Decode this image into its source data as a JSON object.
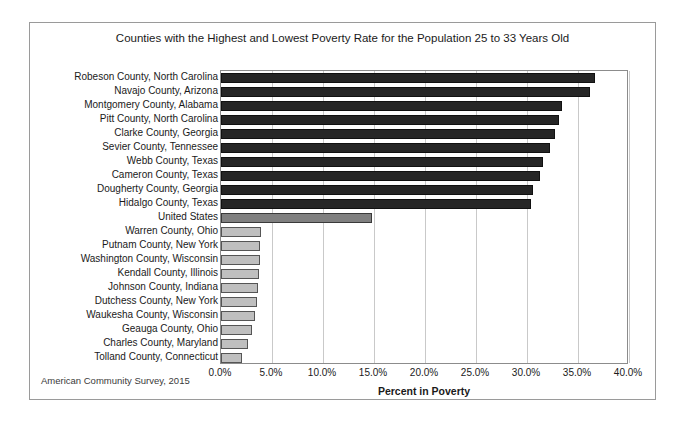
{
  "chart_data": {
    "type": "bar",
    "orientation": "horizontal",
    "title": "Counties with the Highest and Lowest Poverty Rate for the Population 25 to 33 Years Old",
    "xlabel": "Percent in Poverty",
    "ylabel": "",
    "xlim": [
      0,
      40
    ],
    "xtick_labels": [
      "0.0%",
      "5.0%",
      "10.0%",
      "15.0%",
      "20.0%",
      "25.0%",
      "30.0%",
      "35.0%",
      "40.0%"
    ],
    "xtick_values": [
      0,
      5,
      10,
      15,
      20,
      25,
      30,
      35,
      40
    ],
    "grid": true,
    "legend": "none",
    "source_note": "American Community Survey, 2015",
    "categories": [
      "Robeson County, North Carolina",
      "Navajo County, Arizona",
      "Montgomery County, Alabama",
      "Pitt County, North Carolina",
      "Clarke County, Georgia",
      "Sevier County, Tennessee",
      "Webb County, Texas",
      "Cameron County, Texas",
      "Dougherty County, Georgia",
      "Hidalgo County, Texas",
      "United States",
      "Warren County, Ohio",
      "Putnam County, New York",
      "Washington County, Wisconsin",
      "Kendall County, Illinois",
      "Johnson County, Indiana",
      "Dutchess County, New York",
      "Waukesha County, Wisconsin",
      "Geauga County, Ohio",
      "Charles County, Maryland",
      "Tolland County, Connecticut"
    ],
    "values": [
      36.7,
      36.2,
      33.4,
      33.1,
      32.7,
      32.3,
      31.6,
      31.3,
      30.6,
      30.4,
      14.8,
      3.9,
      3.8,
      3.8,
      3.7,
      3.6,
      3.5,
      3.3,
      3.0,
      2.6,
      2.1
    ],
    "series_groups": [
      {
        "name": "Highest poverty counties",
        "color": "#262626",
        "indices": [
          0,
          1,
          2,
          3,
          4,
          5,
          6,
          7,
          8,
          9
        ]
      },
      {
        "name": "United States",
        "color": "#808080",
        "indices": [
          10
        ]
      },
      {
        "name": "Lowest poverty counties",
        "color": "#bfbfbf",
        "indices": [
          11,
          12,
          13,
          14,
          15,
          16,
          17,
          18,
          19,
          20
        ]
      }
    ]
  },
  "colors": {
    "high_bar": "#262626",
    "us_bar": "#808080",
    "low_bar": "#bfbfbf",
    "gridline": "#c9c9c9",
    "frame": "#9a9a9a",
    "text": "#1a1a1a"
  }
}
